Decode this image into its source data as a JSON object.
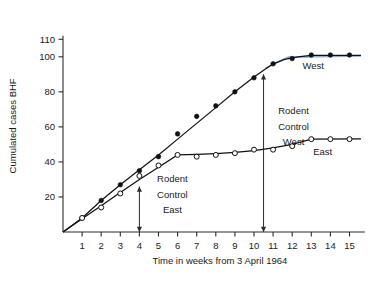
{
  "chart_data": {
    "type": "line",
    "title": "",
    "xlabel": "Time in weeks from 3 April 1964",
    "ylabel": "Cumulated cases BHF",
    "xlim": [
      0,
      15.8
    ],
    "ylim": [
      0,
      112
    ],
    "xticks": [
      1,
      2,
      3,
      4,
      5,
      6,
      7,
      8,
      9,
      10,
      11,
      12,
      13,
      14,
      15
    ],
    "yticks": [
      20,
      40,
      60,
      80,
      100,
      110
    ],
    "grid": false,
    "legend_position": "inline-annotation",
    "x": [
      1,
      2,
      3,
      4,
      5,
      6,
      7,
      8,
      9,
      10,
      11,
      12,
      13,
      14,
      15
    ],
    "series": [
      {
        "name": "West",
        "marker": "filled-circle",
        "color": "#111111",
        "values": [
          8,
          18,
          27,
          35,
          43,
          56,
          66,
          72,
          80,
          88,
          96,
          99,
          101,
          101,
          101
        ]
      },
      {
        "name": "East",
        "marker": "open-circle",
        "color": "#111111",
        "values": [
          8,
          14,
          22,
          32,
          38,
          44,
          43,
          44,
          45,
          47,
          47,
          49,
          53,
          53,
          53
        ]
      }
    ],
    "annotations": [
      {
        "id": "rodent-control-east",
        "lines": [
          "Rodent",
          "Control",
          "East"
        ],
        "x_week": 4,
        "arrow": "double-headed-vertical",
        "arrow_y_top": 26,
        "arrow_y_bottom": 0
      },
      {
        "id": "rodent-control-west",
        "lines": [
          "Rodent",
          "Control",
          "West"
        ],
        "x_week": 10.5,
        "arrow": "double-headed-vertical",
        "arrow_y_top": 90,
        "arrow_y_bottom": 0
      }
    ],
    "series_labels": [
      {
        "text": "West",
        "x_week": 13.1,
        "y_value": 93
      },
      {
        "text": "East",
        "x_week": 13.6,
        "y_value": 44
      }
    ],
    "highlight_color": "#6ba3d6"
  }
}
